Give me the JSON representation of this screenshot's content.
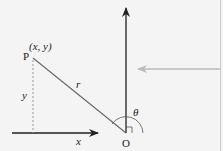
{
  "diagram": {
    "point_label": "P",
    "point_coords": "(x, y)",
    "radius_label": "r",
    "y_label": "y",
    "x_label": "x",
    "origin_label": "O",
    "angle_label": "θ",
    "colors": {
      "background": "#f4f4f4",
      "axis": "#222222",
      "radius_line": "#666666",
      "dashed": "#999999",
      "pointer_arrow": "#bbbbbb",
      "right_border": "#cccccc"
    }
  }
}
